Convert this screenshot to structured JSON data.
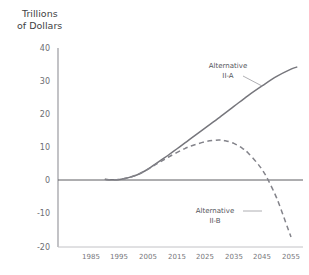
{
  "chart_data": {
    "type": "line",
    "title": "Trillions of Dollars",
    "title_line1": "Trillions",
    "title_line2": "of Dollars",
    "xlabel": "",
    "ylabel": "Trillions of Dollars",
    "xlim": [
      1980,
      2060
    ],
    "ylim": [
      -20,
      40
    ],
    "grid": false,
    "legend_position": "inline-annotations",
    "y_ticks": [
      40,
      30,
      20,
      10,
      0,
      -10,
      -20
    ],
    "y_tick_labels": [
      "40",
      "30",
      "20",
      "10",
      "0",
      "-10",
      "-20"
    ],
    "x_ticks": [
      1985,
      1995,
      2005,
      2015,
      2025,
      2035,
      2045,
      2055
    ],
    "x_tick_labels": [
      "1985",
      "1995",
      "2005",
      "2015",
      "2025",
      "2035",
      "2045",
      "2055"
    ],
    "zero_line": 0,
    "series": [
      {
        "name": "Alternative II-A",
        "style": "solid",
        "color": "#76767c",
        "label_line1": "Alternative",
        "label_line2": "II-A",
        "x": [
          1990,
          1992,
          1994,
          1996,
          1998,
          2000,
          2002,
          2004,
          2006,
          2008,
          2010,
          2012,
          2015,
          2018,
          2020,
          2025,
          2030,
          2035,
          2040,
          2045,
          2050,
          2055,
          2057
        ],
        "values": [
          0.2,
          0.1,
          0.1,
          0.3,
          0.7,
          1.2,
          1.9,
          2.8,
          3.9,
          5.1,
          6.3,
          7.5,
          9.4,
          11.3,
          12.6,
          15.8,
          19.0,
          22.3,
          25.6,
          28.6,
          31.4,
          33.6,
          34.2
        ]
      },
      {
        "name": "Alternative II-B",
        "style": "dashed",
        "color": "#83838a",
        "label_line1": "Alternative",
        "label_line2": "II-B",
        "x": [
          1990,
          1992,
          1994,
          1996,
          1998,
          2000,
          2002,
          2004,
          2006,
          2008,
          2010,
          2012,
          2015,
          2018,
          2020,
          2025,
          2028,
          2030,
          2032,
          2035,
          2038,
          2040,
          2043,
          2045,
          2047,
          2050,
          2053,
          2055
        ],
        "values": [
          0.2,
          0.1,
          0.1,
          0.3,
          0.7,
          1.2,
          1.9,
          2.8,
          3.8,
          4.9,
          5.9,
          6.9,
          8.3,
          9.6,
          10.3,
          11.6,
          12.0,
          12.1,
          11.9,
          11.1,
          9.6,
          8.2,
          5.3,
          3.0,
          0.0,
          -5.5,
          -12.5,
          -17.3
        ]
      }
    ]
  }
}
